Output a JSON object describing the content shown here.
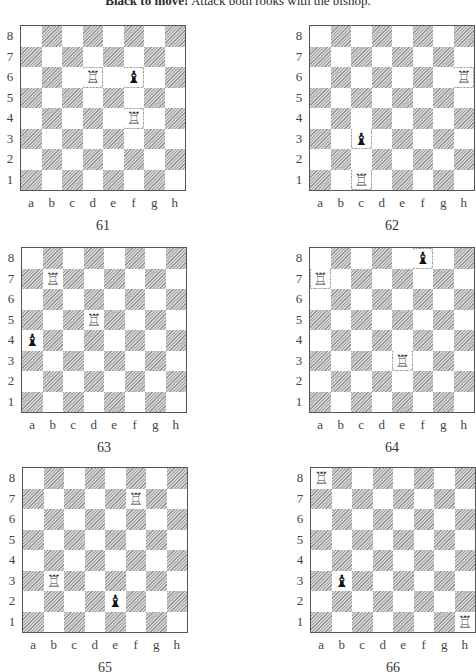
{
  "header": {
    "lead": "Black to move!",
    "instruction": "Attack both rooks with the bishop."
  },
  "labels": {
    "files": [
      "a",
      "b",
      "c",
      "d",
      "e",
      "f",
      "g",
      "h"
    ],
    "ranks": [
      "8",
      "7",
      "6",
      "5",
      "4",
      "3",
      "2",
      "1"
    ]
  },
  "glyphs": {
    "white-rook": "♖",
    "black-bishop": "♝"
  },
  "diagrams": [
    {
      "number": "61",
      "pieces": [
        {
          "square": "d6",
          "type": "white-rook"
        },
        {
          "square": "f4",
          "type": "white-rook"
        },
        {
          "square": "f6",
          "type": "black-bishop"
        }
      ]
    },
    {
      "number": "62",
      "pieces": [
        {
          "square": "h6",
          "type": "white-rook"
        },
        {
          "square": "c1",
          "type": "white-rook"
        },
        {
          "square": "c3",
          "type": "black-bishop"
        }
      ]
    },
    {
      "number": "63",
      "pieces": [
        {
          "square": "b7",
          "type": "white-rook"
        },
        {
          "square": "d5",
          "type": "white-rook"
        },
        {
          "square": "a4",
          "type": "black-bishop"
        }
      ]
    },
    {
      "number": "64",
      "pieces": [
        {
          "square": "a7",
          "type": "white-rook"
        },
        {
          "square": "e3",
          "type": "white-rook"
        },
        {
          "square": "f8",
          "type": "black-bishop"
        }
      ]
    },
    {
      "number": "65",
      "pieces": [
        {
          "square": "f7",
          "type": "white-rook"
        },
        {
          "square": "b3",
          "type": "white-rook"
        },
        {
          "square": "e2",
          "type": "black-bishop"
        }
      ]
    },
    {
      "number": "66",
      "pieces": [
        {
          "square": "a8",
          "type": "white-rook"
        },
        {
          "square": "h1",
          "type": "white-rook"
        },
        {
          "square": "b3",
          "type": "black-bishop"
        }
      ]
    }
  ]
}
